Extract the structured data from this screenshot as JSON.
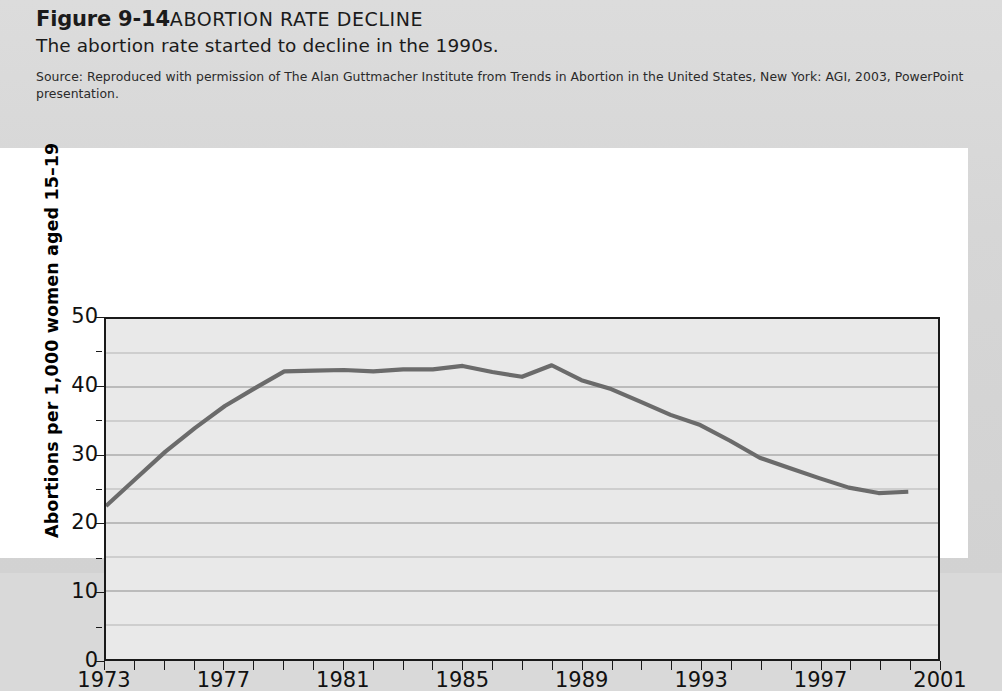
{
  "figure": {
    "label": "Figure 9-14",
    "title": "ABORTION RATE DECLINE",
    "subtitle": "The abortion rate started to decline in the 1990s.",
    "source": "Source: Reproduced with permission of The Alan Guttmacher Institute from Trends in Abortion in the United States, New York: AGI, 2003, PowerPoint presentation."
  },
  "colors": {
    "line": "#6b6b6b",
    "plot_background": "#e9e9e9",
    "panel_background": "#ffffff",
    "page_background": "#d8d8d8",
    "axis": "#1a1a1a",
    "gridline": "#8a8a8a"
  },
  "chart_data": {
    "type": "line",
    "title": "ABORTION RATE DECLINE",
    "xlabel": "",
    "ylabel": "Abortions per 1,000 women aged 15–19",
    "xlim": [
      1973,
      2001
    ],
    "ylim": [
      0,
      50
    ],
    "grid": true,
    "legend": "none",
    "y_major_ticks": [
      0,
      10,
      20,
      30,
      40,
      50
    ],
    "y_minor_ticks": [
      5,
      15,
      25,
      35,
      45
    ],
    "y_tick_labels": [
      "0",
      "10",
      "20",
      "30",
      "40",
      "50"
    ],
    "x_tick_labels": [
      "1973",
      "1977",
      "1981",
      "1985",
      "1989",
      "1993",
      "1997",
      "2001"
    ],
    "x_labeled_years": [
      1973,
      1977,
      1981,
      1985,
      1989,
      1993,
      1997,
      2001
    ],
    "x_all_ticks": [
      1973,
      1974,
      1975,
      1976,
      1977,
      1978,
      1979,
      1980,
      1981,
      1982,
      1983,
      1984,
      1985,
      1986,
      1987,
      1988,
      1989,
      1990,
      1991,
      1992,
      1993,
      1994,
      1995,
      1996,
      1997,
      1998,
      1999,
      2000,
      2001
    ],
    "series": [
      {
        "name": "Abortion rate, women aged 15–19",
        "x": [
          1973,
          1974,
          1975,
          1976,
          1977,
          1978,
          1979,
          1980,
          1981,
          1982,
          1983,
          1984,
          1985,
          1986,
          1987,
          1988,
          1989,
          1990,
          1991,
          1992,
          1993,
          1994,
          1995,
          1996,
          1997,
          1998,
          1999,
          2000
        ],
        "values": [
          22.5,
          26.5,
          30.5,
          34.0,
          37.2,
          39.8,
          42.3,
          42.4,
          42.5,
          42.3,
          42.6,
          42.6,
          43.1,
          42.2,
          41.5,
          43.2,
          41.0,
          39.7,
          37.8,
          35.9,
          34.4,
          32.1,
          29.6,
          28.1,
          26.6,
          25.2,
          24.4,
          24.6
        ]
      }
    ]
  }
}
